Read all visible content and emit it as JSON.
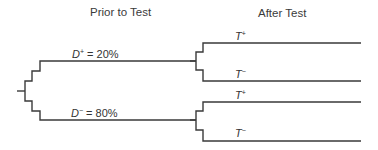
{
  "headers": {
    "prior": "Prior to Test",
    "after": "After Test"
  },
  "disease_branches": {
    "positive": {
      "symbol": "D",
      "sign": "+",
      "value": " = 20%"
    },
    "negative": {
      "symbol": "D",
      "sign": "−",
      "value": " = 80%"
    }
  },
  "test_branches": {
    "upper": {
      "positive": {
        "symbol": "T",
        "sign": "+"
      },
      "negative": {
        "symbol": "T",
        "sign": "−"
      }
    },
    "lower": {
      "positive": {
        "symbol": "T",
        "sign": "+"
      },
      "negative": {
        "symbol": "T",
        "sign": "−"
      }
    }
  },
  "colors": {
    "line": "#3a3a3a",
    "text": "#333333",
    "background": "#ffffff"
  }
}
